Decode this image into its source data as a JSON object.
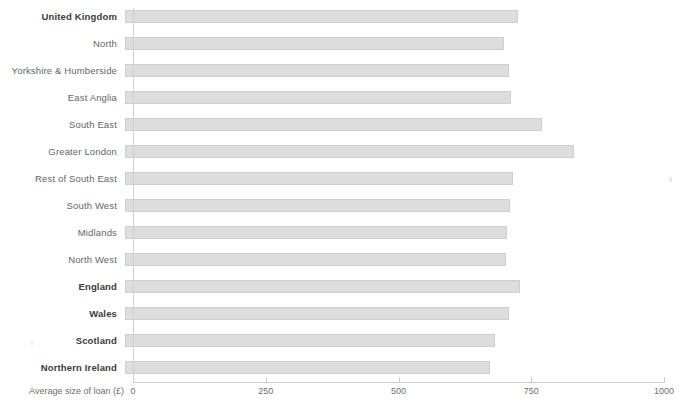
{
  "chart_data": {
    "type": "bar",
    "orientation": "horizontal",
    "title": "",
    "xlabel": "Average size of loan (£)",
    "ylabel": "",
    "xlim": [
      0,
      1000
    ],
    "xticks": [
      0,
      250,
      500,
      750,
      1000
    ],
    "xtick_labels": [
      "0",
      "250",
      "500",
      "750",
      "1000"
    ],
    "grid": false,
    "legend": false,
    "bar_color": "#dddddd",
    "bar_border_color": "#cfcfcf",
    "categories": [
      "United Kingdom",
      "North",
      "Yorkshire & Humberside",
      "East Anglia",
      "South East",
      "Greater London",
      "Rest of South East",
      "South West",
      "Midlands",
      "North West",
      "England",
      "Wales",
      "Scotland",
      "Northern Ireland"
    ],
    "values": [
      740,
      714,
      723,
      727,
      785,
      845,
      730,
      725,
      720,
      718,
      744,
      723,
      697,
      688
    ],
    "emphasis": [
      true,
      false,
      false,
      false,
      false,
      false,
      false,
      false,
      false,
      false,
      true,
      true,
      true,
      true
    ]
  },
  "axis": {
    "title": "Average size of loan (£)"
  }
}
